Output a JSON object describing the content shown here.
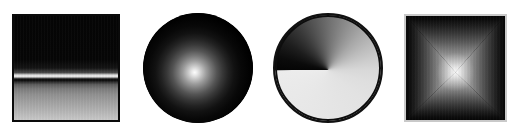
{
  "figure": {
    "width": 518,
    "height": 140,
    "background_color": "#ffffff",
    "panel_count": 4
  },
  "panels": [
    {
      "index": 1,
      "name": "linear-vertical-ramp",
      "shape": "square",
      "gradient_type": "linear",
      "direction": "vertical",
      "border_color": "#0a0a0a",
      "dark_color": "#050505",
      "light_color": "#f2f2f2",
      "end_color": "#c9c9c9",
      "bounds": {
        "x": 12,
        "y": 14,
        "width": 108,
        "height": 108
      },
      "highlight_band_position_pct": 57
    },
    {
      "index": 2,
      "name": "radial-sphere",
      "shape": "circle",
      "gradient_type": "radial",
      "direction": "center-out",
      "border_color": "#000000",
      "dark_color": "#000000",
      "light_color": "#fdfdfd",
      "bounds": {
        "x": 143,
        "y": 13,
        "width": 110,
        "height": 110
      },
      "highlight_center_pct": {
        "x": 47,
        "y": 54
      }
    },
    {
      "index": 3,
      "name": "conic-angular-sweep",
      "shape": "circle",
      "gradient_type": "conic",
      "direction": "clockwise-from-left",
      "border_color": "#0d0d0d",
      "dark_color": "#050505",
      "light_color": "#ececec",
      "bounds": {
        "x": 273,
        "y": 13,
        "width": 110,
        "height": 110
      },
      "seam_angle_deg": 270
    },
    {
      "index": 4,
      "name": "box-pyramid-gradient",
      "shape": "square",
      "gradient_type": "box",
      "direction": "center-out-to-edges",
      "border_color": "#c9c9c9",
      "dark_color": "#060606",
      "light_color": "#f6f6f6",
      "bounds": {
        "x": 404,
        "y": 14,
        "width": 103,
        "height": 108
      },
      "highlight_center_pct": {
        "x": 50,
        "y": 54
      }
    }
  ]
}
